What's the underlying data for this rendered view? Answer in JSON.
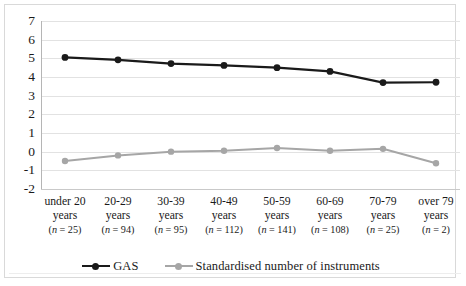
{
  "chart_data": {
    "type": "line",
    "title": "",
    "xlabel": "",
    "ylabel": "",
    "ylim": [
      -2,
      7
    ],
    "yticks": [
      7,
      6,
      5,
      4,
      3,
      2,
      1,
      0,
      -1,
      -2
    ],
    "grid": true,
    "legend_position": "bottom",
    "categories": [
      "under 20 years",
      "20-29 years",
      "30-39 years",
      "40-49 years",
      "50-59 years",
      "60-69 years",
      "70-79 years",
      "over 79 years"
    ],
    "category_lines": [
      {
        "range": "under 20",
        "unit": "years",
        "n": "(n = 25)"
      },
      {
        "range": "20-29",
        "unit": "years",
        "n": "(n = 94)"
      },
      {
        "range": "30-39",
        "unit": "years",
        "n": "(n = 95)"
      },
      {
        "range": "40-49",
        "unit": "years",
        "n": "(n = 112)"
      },
      {
        "range": "50-59",
        "unit": "years",
        "n": "(n = 141)"
      },
      {
        "range": "60-69",
        "unit": "years",
        "n": "(n = 108)"
      },
      {
        "range": "70-79",
        "unit": "years",
        "n": "(n = 25)"
      },
      {
        "range": "over 79",
        "unit": "years",
        "n": "(n = 2)"
      }
    ],
    "series": [
      {
        "name": "GAS",
        "color": "#1a1a1a",
        "values": [
          5.05,
          4.92,
          4.72,
          4.62,
          4.5,
          4.3,
          3.7,
          3.72
        ]
      },
      {
        "name": "Standardised number of instruments",
        "color": "#a6a6a6",
        "values": [
          -0.5,
          -0.2,
          0.0,
          0.05,
          0.2,
          0.05,
          0.15,
          -0.62
        ]
      }
    ]
  },
  "legend": {
    "items": [
      {
        "label": "GAS",
        "color": "#1a1a1a"
      },
      {
        "label": "Standardised number of instruments",
        "color": "#a6a6a6"
      }
    ]
  }
}
